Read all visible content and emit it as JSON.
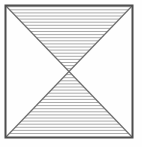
{
  "figure": {
    "name": "hatched-bowtie-square",
    "canvas": {
      "width": 142,
      "height": 147
    },
    "background_color": "#fefefe"
  },
  "frame": {
    "label": "square-outline",
    "left": 5.5,
    "top": 5.5,
    "right": 132.5,
    "bottom": 137.5,
    "stroke_color": "#4d4d4d",
    "stroke_width": 2.0
  },
  "diagonals": [
    {
      "label": "diagonal-top-left-to-bottom-right",
      "x1": 5.5,
      "y1": 5.5,
      "x2": 132.5,
      "y2": 137.5,
      "stroke_color": "#6e6e6e",
      "stroke_width": 1.2
    },
    {
      "label": "diagonal-bottom-left-to-top-right",
      "x1": 5.5,
      "y1": 137.5,
      "x2": 132.5,
      "y2": 5.5,
      "stroke_color": "#6e6e6e",
      "stroke_width": 1.2
    }
  ],
  "crossing_point": {
    "x": 69.0,
    "y": 71.5
  },
  "hatching": {
    "orientation": "horizontal",
    "spacing_px": 3.1,
    "stroke_color": "#a3a3a3",
    "stroke_width": 0.9,
    "filled_regions": [
      "top-triangle",
      "bottom-triangle"
    ],
    "empty_regions": [
      "left-triangle",
      "right-triangle"
    ]
  },
  "regions": {
    "top_triangle": {
      "label": "top-hatched-triangle",
      "points": "5.5,5.5 132.5,5.5 69.0,71.5",
      "filled": true
    },
    "bottom_triangle": {
      "label": "bottom-hatched-triangle",
      "points": "5.5,137.5 132.5,137.5 69.0,71.5",
      "filled": true
    },
    "left_triangle": {
      "label": "left-empty-triangle",
      "points": "5.5,5.5 5.5,137.5 69.0,71.5",
      "filled": false
    },
    "right_triangle": {
      "label": "right-empty-triangle",
      "points": "132.5,5.5 132.5,137.5 69.0,71.5",
      "filled": false
    }
  }
}
